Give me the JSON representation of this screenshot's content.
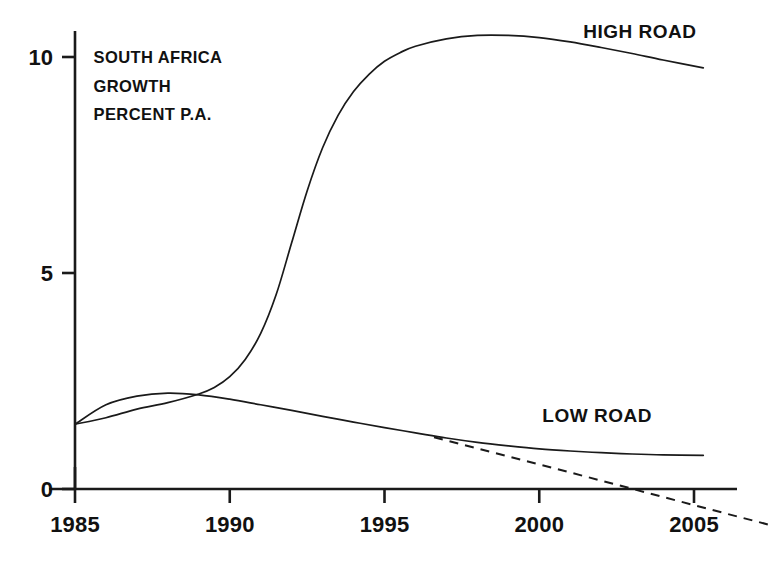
{
  "chart_data": {
    "type": "line",
    "title": "",
    "caption_lines": [
      "SOUTH AFRICA",
      "GROWTH",
      "PERCENT P.A."
    ],
    "xlabel": "",
    "ylabel": "",
    "xlim": [
      1985,
      2005.4
    ],
    "ylim": [
      0,
      10.6
    ],
    "xticks": [
      1985,
      1990,
      1995,
      2000,
      2005
    ],
    "xtick_labels": [
      "1985",
      "1990",
      "1995",
      "2000",
      "2005"
    ],
    "yticks": [
      0,
      5,
      10
    ],
    "ytick_labels": [
      "0",
      "5",
      "10"
    ],
    "grid": false,
    "legend_position": "inline-right",
    "line_color": "#1a1a1a",
    "background_color": "#ffffff",
    "series": [
      {
        "name": "HIGH ROAD",
        "style": "solid",
        "label_x": 2004.2,
        "label_y": 10.45,
        "x": [
          1985,
          1986,
          1987,
          1988,
          1989,
          1989.5,
          1990,
          1990.5,
          1991,
          1991.5,
          1992,
          1992.5,
          1993,
          1993.5,
          1994,
          1994.5,
          1995,
          1995.5,
          1996,
          1997,
          1998,
          1999,
          2000,
          2001,
          2002,
          2003,
          2004,
          2005.3
        ],
        "y": [
          1.5,
          1.65,
          1.85,
          2.0,
          2.2,
          2.35,
          2.6,
          3.0,
          3.6,
          4.5,
          5.7,
          6.9,
          7.9,
          8.65,
          9.2,
          9.6,
          9.9,
          10.1,
          10.25,
          10.42,
          10.5,
          10.5,
          10.45,
          10.35,
          10.22,
          10.08,
          9.93,
          9.75
        ]
      },
      {
        "name": "LOW ROAD",
        "style": "solid",
        "label_x": 2000.1,
        "label_y": 1.55,
        "x": [
          1985,
          1986,
          1987,
          1988,
          1989,
          1990,
          1991,
          1992,
          1993,
          1994,
          1995,
          1996,
          1997,
          1998,
          1999,
          2000,
          2001,
          2002,
          2003,
          2004,
          2005.3
        ],
        "y": [
          1.5,
          1.95,
          2.15,
          2.22,
          2.18,
          2.08,
          1.95,
          1.82,
          1.68,
          1.55,
          1.42,
          1.3,
          1.18,
          1.08,
          1.0,
          0.93,
          0.88,
          0.84,
          0.81,
          0.79,
          0.78
        ]
      },
      {
        "name": "LOW ROAD DOWNSIDE",
        "style": "dashed",
        "label_x": null,
        "label_y": null,
        "x": [
          1996.6,
          1998,
          2000,
          2002.5,
          2005.4,
          2007.6
        ],
        "y": [
          1.2,
          0.94,
          0.57,
          0.1,
          -0.45,
          -0.86
        ]
      }
    ],
    "annotations": [
      {
        "text": "SOUTH AFRICA",
        "x": 1985.6,
        "y": 9.85
      },
      {
        "text": "GROWTH",
        "x": 1985.6,
        "y": 9.2
      },
      {
        "text": "PERCENT P.A.",
        "x": 1985.6,
        "y": 8.55
      }
    ]
  }
}
